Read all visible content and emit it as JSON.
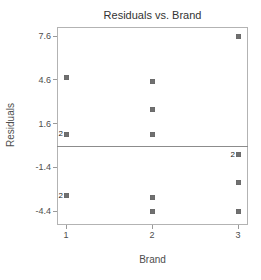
{
  "chart_data": {
    "type": "scatter",
    "title": "Residuals vs. Brand",
    "xlabel": "Brand",
    "ylabel": "Residuals",
    "xlim": [
      0.895,
      3.116
    ],
    "ylim": [
      -5.36,
      8.22
    ],
    "grid": false,
    "legend": false,
    "reference_line_y": 0,
    "x_ticks": [
      {
        "label": "1",
        "value": 1
      },
      {
        "label": "2",
        "value": 2
      },
      {
        "label": "3",
        "value": 3
      }
    ],
    "y_ticks": [
      {
        "label": "7.6",
        "value": 7.6
      },
      {
        "label": "4.6",
        "value": 4.6
      },
      {
        "label": "1.6",
        "value": 1.6
      },
      {
        "label": "-1.4",
        "value": -1.4
      },
      {
        "label": "-4.4",
        "value": -4.4
      }
    ],
    "points": [
      {
        "x": 1,
        "y": 4.75,
        "count": 1
      },
      {
        "x": 1,
        "y": 0.85,
        "count": 2
      },
      {
        "x": 1,
        "y": -3.35,
        "count": 2
      },
      {
        "x": 2,
        "y": 4.5,
        "count": 1
      },
      {
        "x": 2,
        "y": 2.55,
        "count": 1
      },
      {
        "x": 2,
        "y": 0.85,
        "count": 1
      },
      {
        "x": 2,
        "y": -3.45,
        "count": 1
      },
      {
        "x": 2,
        "y": -4.4,
        "count": 1
      },
      {
        "x": 3,
        "y": 7.6,
        "count": 1
      },
      {
        "x": 3,
        "y": -0.55,
        "count": 2
      },
      {
        "x": 3,
        "y": -2.45,
        "count": 1
      },
      {
        "x": 3,
        "y": -4.4,
        "count": 1
      }
    ],
    "colors": {
      "marker": "#707070",
      "frame": "#b3b3b3",
      "reference_line": "#8c8c8c",
      "tick": "#9a9a9a",
      "tick_label": "#4d4d4d",
      "title": "#333333"
    }
  }
}
